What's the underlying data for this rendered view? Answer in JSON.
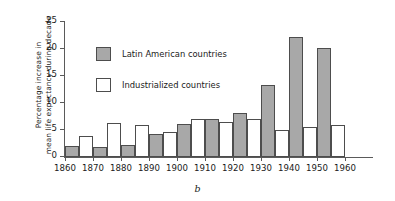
{
  "chart_data": {
    "type": "bar",
    "title": "",
    "subtitle": "",
    "caption": "b",
    "xlabel": "",
    "ylabel_line1": "Percentage increase in",
    "ylabel_line2": "mean life expectancy during decade",
    "categories": [
      "1860",
      "1870",
      "1880",
      "1890",
      "1900",
      "1910",
      "1920",
      "1930",
      "1940",
      "1950",
      "1960"
    ],
    "xtick_labels": [
      "1860",
      "1870",
      "1880",
      "1890",
      "1900",
      "1910",
      "1920",
      "1930",
      "1940",
      "1950",
      "1960"
    ],
    "ytick_labels": [
      "0",
      "5",
      "10",
      "15",
      "20",
      "25"
    ],
    "ytick_values": [
      0,
      5,
      10,
      15,
      20,
      25
    ],
    "ylim": [
      0,
      25
    ],
    "grid": false,
    "legend_position": "upper left inside",
    "series": [
      {
        "name": "Latin American countries",
        "color": "#a8a8a8",
        "values": [
          2.1,
          1.8,
          2.2,
          4.2,
          6.2,
          7.0,
          8.1,
          13.3,
          22.2,
          20.1,
          null
        ]
      },
      {
        "name": "Industrialized countries",
        "color": "#ffffff",
        "values": [
          3.9,
          6.3,
          6.0,
          4.7,
          7.1,
          6.5,
          7.1,
          5.0,
          5.6,
          6.0,
          null
        ]
      }
    ]
  },
  "legend": {
    "items": [
      {
        "label": "Latin American countries",
        "swatch": "latin"
      },
      {
        "label": "Industrialized countries",
        "swatch": "indus"
      }
    ]
  }
}
